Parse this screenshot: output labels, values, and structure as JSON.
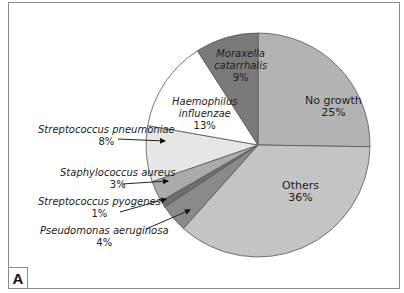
{
  "chart_data": {
    "type": "pie",
    "title": "",
    "start_angle_deg": 0,
    "direction": "clockwise",
    "slices": [
      {
        "label": "No growth",
        "value": 25,
        "display": "25%",
        "color": "#b3b3b3",
        "italic": false
      },
      {
        "label": "Others",
        "value": 36,
        "display": "36%",
        "color": "#c4c4c4",
        "italic": false
      },
      {
        "label": "Pseudomonas aeruginosa",
        "value": 4,
        "display": "4%",
        "color": "#8a8a8a",
        "italic": true
      },
      {
        "label": "Streptococcus pyogenes",
        "value": 1,
        "display": "1%",
        "color": "#6e6e6e",
        "italic": true
      },
      {
        "label": "Staphylococcus aureus",
        "value": 3,
        "display": "3%",
        "color": "#ababab",
        "italic": true
      },
      {
        "label": "Streptococcus pneumoniae",
        "value": 8,
        "display": "8%",
        "color": "#e6e6e6",
        "italic": true
      },
      {
        "label": "Haemophilus influenzae",
        "value": 13,
        "display": "13%",
        "color": "#ffffff",
        "italic": true
      },
      {
        "label": "Moraxella catarrhalis",
        "value": 9,
        "display": "9%",
        "color": "#7a7a7a",
        "italic": true
      }
    ],
    "legend": "none",
    "annotations": [
      "callout arrows for small slices"
    ]
  },
  "labels": {
    "no_growth": {
      "name": "No growth",
      "pct": "25%"
    },
    "others": {
      "name": "Others",
      "pct": "36%"
    },
    "moraxella": {
      "line1": "Moraxella",
      "line2": "catarrhalis",
      "pct": "9%"
    },
    "haemophilus": {
      "line1": "Haemophilus",
      "line2": "influenzae",
      "pct": "13%"
    },
    "pneumoniae": {
      "name": "Streptococcus pneumoniae",
      "pct": "8%"
    },
    "aureus": {
      "name": "Staphylococcus aureus",
      "pct": "3%"
    },
    "pyogenes": {
      "name": "Streptococcus pyogenes",
      "pct": "1%"
    },
    "pseudomonas": {
      "name": "Pseudomonas aeruginosa",
      "pct": "4%"
    }
  },
  "panel_letter": "A"
}
